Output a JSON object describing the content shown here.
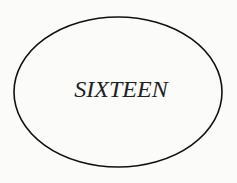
{
  "diagram": {
    "shape": "ellipse",
    "label": "SIXTEEN",
    "stroke_color": "#111111",
    "background_color": "#fbfbf9"
  }
}
